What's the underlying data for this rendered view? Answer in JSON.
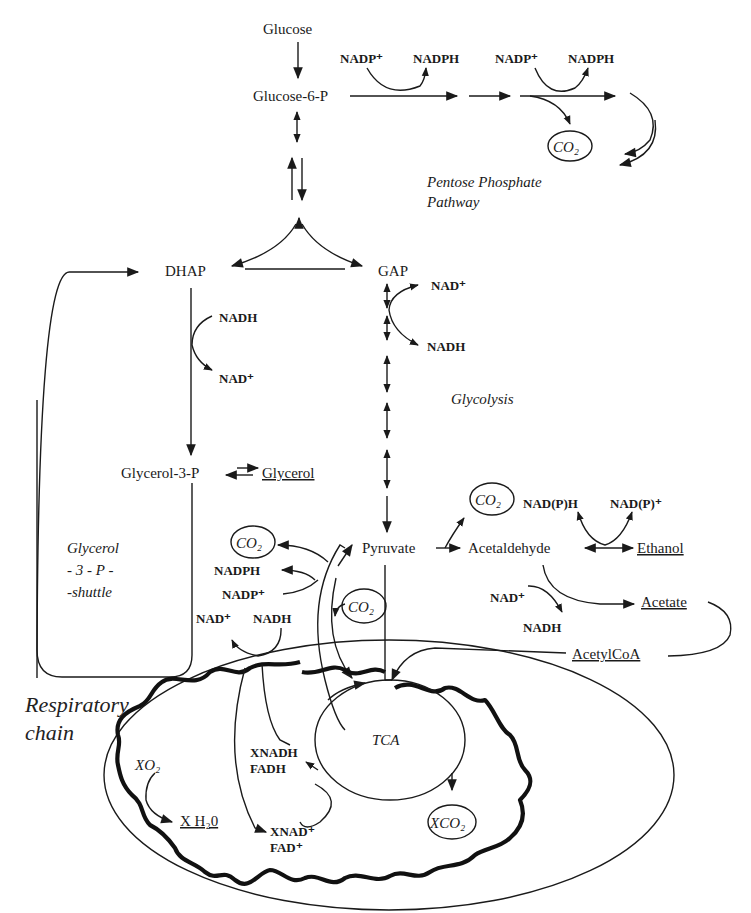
{
  "diagram": {
    "metabolites": {
      "glucose": "Glucose",
      "glucose6p": "Glucose-6-P",
      "dhap": "DHAP",
      "gap": "GAP",
      "glycerol3p": "Glycerol-3-P",
      "glycerol": "Glycerol",
      "pyruvate": "Pyruvate",
      "acetaldehyde": "Acetaldehyde",
      "ethanol": "Ethanol",
      "acetate": "Acetate",
      "acetylcoa": "AcetylCoA"
    },
    "cofactors": {
      "ppp_nadp_1": "NADP⁺",
      "ppp_nadph_1": "NADPH",
      "ppp_nadp_2": "NADP⁺",
      "ppp_nadph_2": "NADPH",
      "g3p_nadh": "NADH",
      "g3p_nad": "NAD⁺",
      "gap_nad": "NAD⁺",
      "gap_nadh": "NADH",
      "eth_nadph": "NAD(P)H",
      "eth_nadp": "NAD(P)⁺",
      "acet_nad": "NAD⁺",
      "acet_nadh": "NADH",
      "mito_nadph": "NADPH",
      "mito_nadp": "NADP⁺",
      "mito_nad": "NAD⁺",
      "mito_nadh": "NADH",
      "xnadh": "XNADH",
      "fadh": "FADH",
      "xnad": "XNAD⁺",
      "fad": "FAD⁺",
      "xo2": "XO₂",
      "xh2o": "X H₂0",
      "co2_ppp": "CO₂",
      "co2_pdc": "CO₂",
      "co2_left": "CO₂",
      "co2_mid": "CO₂",
      "xco2": "XCO₂"
    },
    "pathways": {
      "ppp_line1": "Pentose Phosphate",
      "ppp_line2": "Pathway",
      "glycolysis": "Glycolysis",
      "shuttle_line1": "Glycerol",
      "shuttle_line2": "- 3 - P -",
      "shuttle_line3": "-shuttle",
      "resp_line1": "Respiratory",
      "resp_line2": "chain",
      "tca": "TCA"
    },
    "colors": {
      "ink": "#1a1a1a",
      "background": "#ffffff"
    }
  }
}
